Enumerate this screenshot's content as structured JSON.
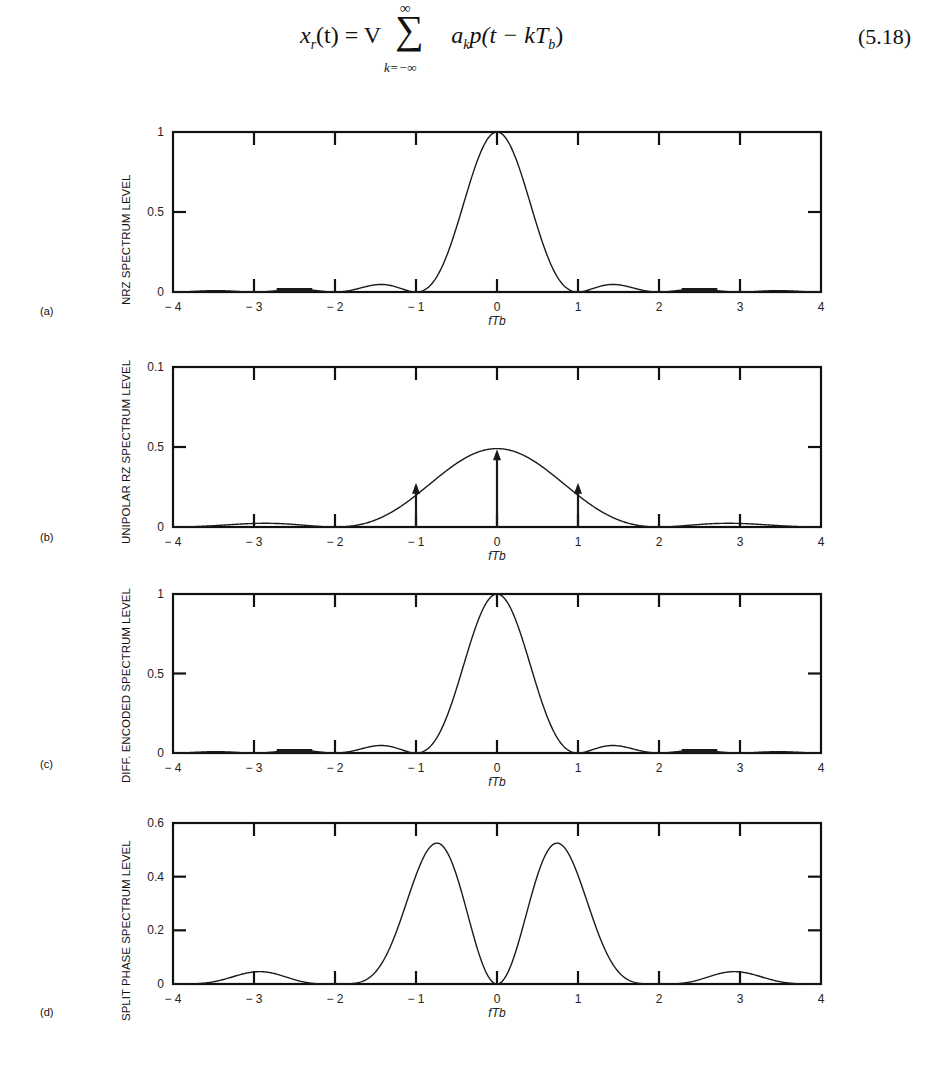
{
  "equation": {
    "lhs": "x",
    "lhs_sub": "r",
    "lhs_arg": "(t) = V",
    "sum_upper": "∞",
    "sum_lower": "k=−∞",
    "rhs": "a",
    "rhs_sub": "k",
    "rhs_tail": "p(t − kT",
    "rhs_tail_sub": "b",
    "rhs_close": ")",
    "number": "(5.18)"
  },
  "chart_data": [
    {
      "panel": "(a)",
      "type": "line",
      "title": "",
      "xlabel": "fTb",
      "ylabel": "NRZ SPECTRUM LEVEL",
      "xlim": [
        -4,
        4
      ],
      "ylim": [
        0,
        1
      ],
      "x_ticks": [
        "− 4",
        "− 3",
        "− 2",
        "− 1",
        "0",
        "1",
        "2",
        "3",
        "4"
      ],
      "y_ticks": [
        "0",
        "0.5",
        "1"
      ],
      "y_tick_values": [
        0,
        0.5,
        1
      ],
      "grid": false,
      "function": "sinc2",
      "description": "sinc^2(fTb): main lobe peak 1.0 at 0, nulls at ±1, ±2, ±3; sidelobes ≈0.047 at ±1.5, ≈0.016 at ±2.5",
      "x": [
        -4,
        -3.5,
        -3,
        -2.5,
        -2,
        -1.5,
        -1,
        -0.75,
        -0.5,
        -0.25,
        0,
        0.25,
        0.5,
        0.75,
        1,
        1.5,
        2,
        2.5,
        3,
        3.5,
        4
      ],
      "values": [
        0,
        0.008,
        0,
        0.016,
        0,
        0.045,
        0,
        0.16,
        0.405,
        0.81,
        1.0,
        0.81,
        0.405,
        0.16,
        0,
        0.045,
        0,
        0.016,
        0,
        0.008,
        0
      ],
      "impulses": []
    },
    {
      "panel": "(b)",
      "type": "line",
      "title": "",
      "xlabel": "fTb",
      "ylabel": "UNIPOLAR RZ SPECTRUM LEVEL",
      "xlim": [
        -4,
        4
      ],
      "ylim": [
        0,
        1
      ],
      "x_ticks": [
        "− 4",
        "− 3",
        "− 2",
        "− 1",
        "0",
        "1",
        "2",
        "3",
        "4"
      ],
      "y_ticks": [
        "0",
        "0.5",
        "0.1"
      ],
      "y_tick_values": [
        0,
        0.5,
        1
      ],
      "grid": false,
      "function": "half_sinc2",
      "description": "0.49·sinc^2(fTb/2): broad main lobe peak ≈0.49 at 0, nulls at ±2; sidelobes ≈0.055 at ±3; discrete spectral lines (arrows) at 0 (≈0.48) and ±1 (≈0.27)",
      "x": [
        -4,
        -3.5,
        -3,
        -2.5,
        -2,
        -1.5,
        -1,
        -0.5,
        0,
        0.5,
        1,
        1.5,
        2,
        2.5,
        3,
        3.5,
        4
      ],
      "values": [
        0,
        0.04,
        0.055,
        0.03,
        0,
        0.09,
        0.27,
        0.43,
        0.49,
        0.43,
        0.27,
        0.09,
        0,
        0.03,
        0.055,
        0.04,
        0
      ],
      "impulses": [
        {
          "x": -1,
          "value": 0.27
        },
        {
          "x": 0,
          "value": 0.48
        },
        {
          "x": 1,
          "value": 0.27
        }
      ]
    },
    {
      "panel": "(c)",
      "type": "line",
      "title": "",
      "xlabel": "fTb",
      "ylabel": "DIFF. ENCODED SPECTRUM LEVEL",
      "xlim": [
        -4,
        4
      ],
      "ylim": [
        0,
        1
      ],
      "x_ticks": [
        "− 4",
        "− 3",
        "− 2",
        "− 1",
        "0",
        "1",
        "2",
        "3",
        "4"
      ],
      "y_ticks": [
        "0",
        "0.5",
        "1"
      ],
      "y_tick_values": [
        0,
        0.5,
        1
      ],
      "grid": false,
      "function": "sinc2",
      "description": "Identical to NRZ: sinc^2(fTb), peak 1.0 at 0, nulls at integers",
      "x": [
        -4,
        -3.5,
        -3,
        -2.5,
        -2,
        -1.5,
        -1,
        -0.75,
        -0.5,
        -0.25,
        0,
        0.25,
        0.5,
        0.75,
        1,
        1.5,
        2,
        2.5,
        3,
        3.5,
        4
      ],
      "values": [
        0,
        0.008,
        0,
        0.016,
        0,
        0.045,
        0,
        0.16,
        0.405,
        0.81,
        1.0,
        0.81,
        0.405,
        0.16,
        0,
        0.045,
        0,
        0.016,
        0,
        0.008,
        0
      ],
      "impulses": []
    },
    {
      "panel": "(d)",
      "type": "line",
      "title": "",
      "xlabel": "fTb",
      "ylabel": "SPLIT PHASE SPECTRUM LEVEL",
      "xlim": [
        -4,
        4
      ],
      "ylim": [
        0,
        0.6
      ],
      "x_ticks": [
        "− 4",
        "− 3",
        "− 2",
        "− 1",
        "0",
        "1",
        "2",
        "3",
        "4"
      ],
      "y_ticks": [
        "0",
        "0.2",
        "0.4",
        "0.6"
      ],
      "y_tick_values": [
        0,
        0.2,
        0.4,
        0.6
      ],
      "grid": false,
      "function": "split_phase",
      "description": "sinc^2(fTb/2)·sin^2(πfTb/2): zero at 0, twin peaks ≈0.46 at ±0.74, nulls at ±2, sidelobes ≈0.05 at ±3",
      "x": [
        -4,
        -3.5,
        -3,
        -2.5,
        -2,
        -1.5,
        -1,
        -0.74,
        -0.5,
        -0.25,
        0,
        0.25,
        0.5,
        0.74,
        1,
        1.5,
        2,
        2.5,
        3,
        3.5,
        4
      ],
      "values": [
        0,
        0.04,
        0.045,
        0.03,
        0,
        0.09,
        0.41,
        0.46,
        0.41,
        0.14,
        0,
        0.14,
        0.41,
        0.46,
        0.41,
        0.09,
        0,
        0.03,
        0.045,
        0.04,
        0
      ],
      "impulses": []
    }
  ],
  "panels": [
    {
      "letter": "(a)",
      "ylabel": "NRZ SPECTRUM LEVEL",
      "xlabel": "fTb"
    },
    {
      "letter": "(b)",
      "ylabel": "UNIPOLAR RZ SPECTRUM LEVEL",
      "xlabel": "fTb"
    },
    {
      "letter": "(c)",
      "ylabel": "DIFF. ENCODED SPECTRUM LEVEL",
      "xlabel": "fTb"
    },
    {
      "letter": "(d)",
      "ylabel": "SPLIT PHASE SPECTRUM LEVEL",
      "xlabel": "fTb"
    }
  ],
  "colors": {
    "line": "#1a1a1a",
    "frame": "#111111",
    "background": "#ffffff"
  }
}
